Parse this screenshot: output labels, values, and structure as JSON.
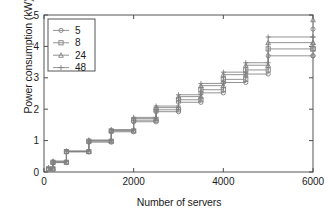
{
  "chart_data": {
    "type": "line",
    "title": "",
    "subtitle": "",
    "xlabel": "Number of servers",
    "ylabel": "Power consumption (kW)",
    "xlim": [
      0,
      6000
    ],
    "ylim": [
      0,
      5
    ],
    "xticks": [
      0,
      2000,
      4000,
      6000
    ],
    "xticklabels": [
      "0",
      "2000",
      "4000",
      "6000"
    ],
    "yticks": [
      0,
      1,
      2,
      3,
      4,
      5
    ],
    "yticklabels": [
      "0",
      "1",
      "2",
      "3",
      "4",
      "5"
    ],
    "grid": false,
    "legend_position": "upper left",
    "legend_title": "",
    "line_color": "#808080",
    "marker_edge_color": "#808080",
    "axis_color": "#4d4d4d",
    "series": [
      {
        "name": "5",
        "marker": "circle",
        "x": [
          100,
          200,
          200,
          500,
          500,
          1000,
          1000,
          1500,
          1500,
          2000,
          2000,
          2500,
          2500,
          3000,
          3000,
          3500,
          3500,
          4000,
          4000,
          4500,
          4500,
          5000,
          5000,
          6000
        ],
        "y": [
          0.08,
          0.08,
          0.3,
          0.3,
          0.64,
          0.64,
          0.95,
          0.95,
          1.28,
          1.28,
          1.6,
          1.6,
          1.92,
          1.92,
          2.22,
          2.22,
          2.52,
          2.52,
          2.85,
          2.85,
          3.12,
          3.12,
          3.7,
          3.7
        ]
      },
      {
        "name": "8",
        "marker": "square",
        "x": [
          100,
          200,
          200,
          500,
          500,
          1000,
          1000,
          1500,
          1500,
          2000,
          2000,
          2500,
          2500,
          3000,
          3000,
          3500,
          3500,
          4000,
          4000,
          4500,
          4500,
          5000,
          5000,
          6000
        ],
        "y": [
          0.1,
          0.1,
          0.31,
          0.31,
          0.65,
          0.65,
          0.98,
          0.98,
          1.31,
          1.31,
          1.65,
          1.65,
          1.98,
          1.98,
          2.3,
          2.3,
          2.62,
          2.62,
          2.95,
          2.95,
          3.25,
          3.25,
          3.92,
          3.92
        ]
      },
      {
        "name": "24",
        "marker": "triangle",
        "x": [
          100,
          200,
          200,
          500,
          500,
          1000,
          1000,
          1500,
          1500,
          2000,
          2000,
          2500,
          2500,
          3000,
          3000,
          3500,
          3500,
          4000,
          4000,
          4500,
          4500,
          5000,
          5000,
          6000
        ],
        "y": [
          0.12,
          0.12,
          0.33,
          0.33,
          0.66,
          0.66,
          1.0,
          1.0,
          1.33,
          1.33,
          1.7,
          1.7,
          2.05,
          2.05,
          2.4,
          2.4,
          2.75,
          2.75,
          3.1,
          3.1,
          3.4,
          3.4,
          4.12,
          4.12
        ]
      },
      {
        "name": "48",
        "marker": "plus",
        "x": [
          100,
          200,
          200,
          500,
          500,
          1000,
          1000,
          1500,
          1500,
          2000,
          2000,
          2500,
          2500,
          3000,
          3000,
          3500,
          3500,
          4000,
          4000,
          4500,
          4500,
          5000,
          5000,
          6000
        ],
        "y": [
          0.14,
          0.14,
          0.35,
          0.35,
          0.67,
          0.67,
          1.02,
          1.02,
          1.35,
          1.35,
          1.74,
          1.74,
          2.1,
          2.1,
          2.46,
          2.46,
          2.82,
          2.82,
          3.18,
          3.18,
          3.48,
          3.48,
          4.3,
          4.3
        ]
      }
    ],
    "extra_markers": {
      "note": "top-right stack at x=6000 rising to ~4.85",
      "x": 6000,
      "y": [
        3.7,
        3.92,
        4.12,
        4.3,
        4.55,
        4.85
      ]
    }
  },
  "legend": {
    "items": [
      {
        "label": "5",
        "marker": "circle-marker"
      },
      {
        "label": "8",
        "marker": "square-marker"
      },
      {
        "label": "24",
        "marker": "triangle-marker"
      },
      {
        "label": "48",
        "marker": "plus-marker"
      }
    ]
  }
}
